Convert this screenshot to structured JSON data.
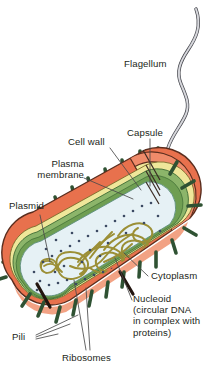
{
  "figure": {
    "background_color": "#ffffff"
  },
  "labels": {
    "flagellum": "Flagellum",
    "capsule": "Capsule",
    "cell_wall": "Cell wall",
    "plasma_membrane": "Plasma\nmembrane",
    "plasmid": "Plasmid",
    "cytoplasm": "Cytoplasm",
    "nucleoid": "Nucleoid\n(circular DNA\nin complex with\nproteins)",
    "pili": "Pili",
    "ribosomes": "Ribosomes"
  },
  "colors": {
    "capsule_outer": "#e8714d",
    "capsule_mid": "#ef8b6a",
    "capsule_light": "#f3a88c",
    "cell_wall_yellow": "#eee896",
    "plasma_membrane_green": "#8cb56a",
    "plasma_membrane_dark": "#5f8f4a",
    "cytoplasm": "#e6f1f5",
    "nucleoid_dna": "#9b8f36",
    "plasmid_dna": "#9b8f36",
    "ribosome_dot": "#3c4a63",
    "pili_green": "#2f5233",
    "flagellum_gray": "#b7b8bd",
    "outline": "#3a2a22",
    "text": "#231f20",
    "leader_line": "#555555"
  },
  "structures": {
    "flagellum": {
      "name": "flagellum",
      "shape": "long wavy filament",
      "count": 1
    },
    "capsule": {
      "name": "capsule",
      "shape": "outermost rod-shaped envelope"
    },
    "cell_wall": {
      "name": "cell wall",
      "shape": "yellow layer beneath capsule"
    },
    "plasma_membrane": {
      "name": "plasma membrane",
      "shape": "green layer inside cell wall"
    },
    "cytoplasm": {
      "name": "cytoplasm",
      "shape": "pale blue interior"
    },
    "nucleoid": {
      "name": "nucleoid",
      "shape": "tangled circular DNA mass"
    },
    "plasmid": {
      "name": "plasmid",
      "shape": "small circular DNA loop"
    },
    "ribosomes": {
      "name": "ribosomes",
      "shape": "small dots",
      "count": 42
    },
    "pili": {
      "name": "pili",
      "shape": "short rod projections",
      "count": 22
    }
  }
}
